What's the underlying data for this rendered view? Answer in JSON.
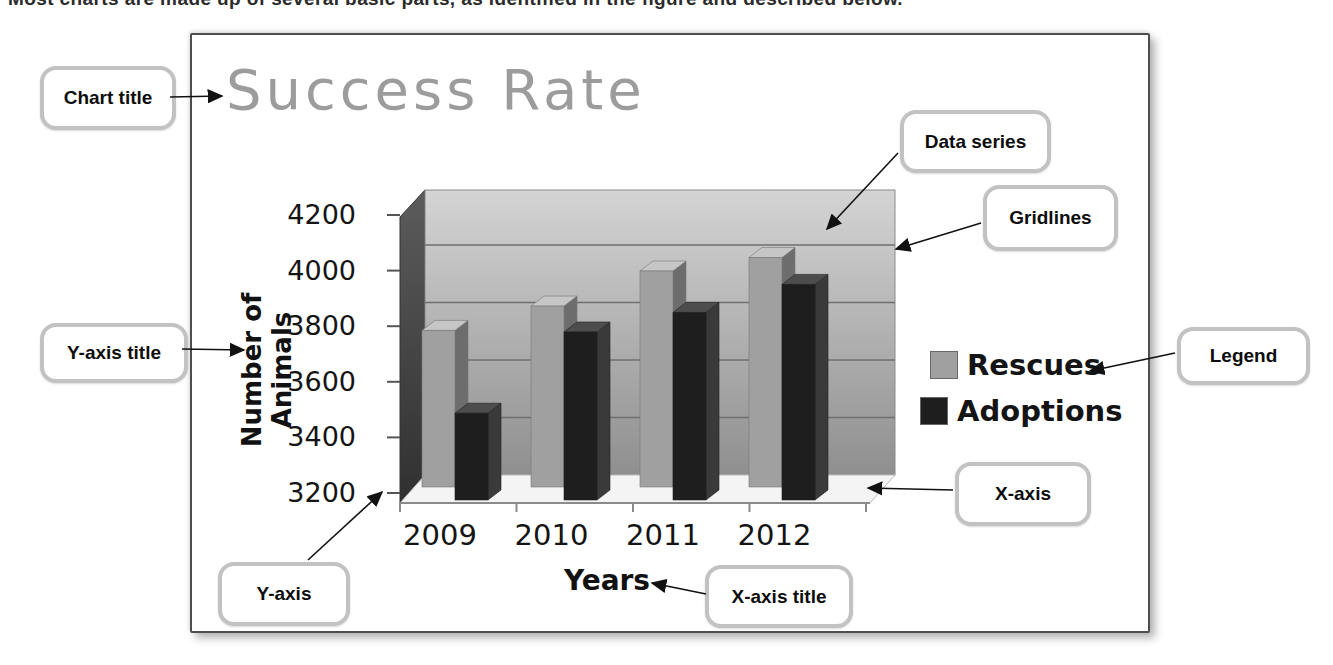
{
  "page": {
    "top_text": "Most charts are made up of several basic parts, as identified in the figure and described below."
  },
  "callouts": {
    "chart_title": "Chart title",
    "y_axis_title": "Y-axis title",
    "y_axis": "Y-axis",
    "x_axis_title": "X-axis title",
    "x_axis": "X-axis",
    "data_series": "Data series",
    "gridlines": "Gridlines",
    "legend": "Legend"
  },
  "chart_data": {
    "type": "bar",
    "variant": "3d-column",
    "title": "Success Rate",
    "xlabel": "Years",
    "ylabel": "Number of Animals",
    "categories": [
      "2009",
      "2010",
      "2011",
      "2012"
    ],
    "series": [
      {
        "name": "Rescues",
        "values": [
          3780,
          3870,
          4000,
          4050
        ],
        "color": "#a0a0a0"
      },
      {
        "name": "Adoptions",
        "values": [
          3510,
          3800,
          3870,
          3970
        ],
        "color": "#1e1e1e"
      }
    ],
    "ylim": [
      3200,
      4200
    ],
    "ytick_step": 200,
    "yticks": [
      4200,
      4000,
      3800,
      3600,
      3400,
      3200
    ],
    "gridlines": true,
    "legend_position": "right"
  },
  "colors": {
    "title_gray": "#9c9c9c",
    "rescues_front": "#a0a0a0",
    "rescues_top": "#c6c6c6",
    "rescues_side": "#6d6d6d",
    "adoptions_front": "#1e1e1e",
    "adoptions_top": "#4d4d4d",
    "adoptions_side": "#3a3a3a",
    "wall_top": "#d4d4d4",
    "wall_bottom": "#8f8f8f",
    "left_wall_top": "#5c5c5c",
    "left_wall_bottom": "#303030",
    "floor": "#f4f4f4",
    "gridline": "#6f6f6f",
    "axis_line": "#8a8a8a",
    "callout_border": "#c2c2c2",
    "arrow": "#111111"
  }
}
